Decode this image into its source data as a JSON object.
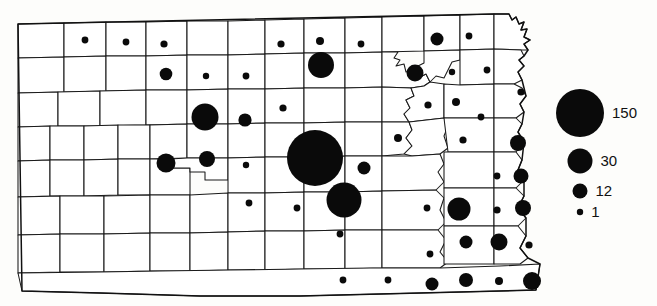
{
  "figure": {
    "type": "proportional-symbol-map",
    "region": "Kansas counties",
    "background": "#fdfdfb",
    "symbol_color": "#0a0a0a",
    "boundary_color": "#1a1a1a"
  },
  "legend": {
    "name": "symbol-size-legend",
    "entries": [
      {
        "label": "150",
        "value": 150,
        "radius": 24,
        "cx": 580,
        "cy": 113
      },
      {
        "label": "30",
        "value": 30,
        "radius": 12.5,
        "cx": 580,
        "cy": 161
      },
      {
        "label": "12",
        "value": 12,
        "radius": 7.5,
        "cx": 580,
        "cy": 191
      },
      {
        "label": "1",
        "value": 1,
        "radius": 3.2,
        "cx": 580,
        "cy": 212
      }
    ]
  },
  "chart_data": {
    "type": "scatter",
    "title": "",
    "xlabel": "",
    "ylabel": "",
    "legend_position": "right",
    "grid": false,
    "size_legend_values": [
      150,
      30,
      12,
      1
    ],
    "symbols": [
      {
        "cx": 85,
        "cy": 40,
        "r": 3.4
      },
      {
        "cx": 126,
        "cy": 42,
        "r": 3.4
      },
      {
        "cx": 164,
        "cy": 44,
        "r": 3.6
      },
      {
        "cx": 281,
        "cy": 44,
        "r": 3.6
      },
      {
        "cx": 320,
        "cy": 41,
        "r": 4.0
      },
      {
        "cx": 361,
        "cy": 44,
        "r": 3.4
      },
      {
        "cx": 437,
        "cy": 39,
        "r": 6.5
      },
      {
        "cx": 469,
        "cy": 36,
        "r": 3.4
      },
      {
        "cx": 166,
        "cy": 74,
        "r": 6.3
      },
      {
        "cx": 206,
        "cy": 76,
        "r": 3.2
      },
      {
        "cx": 246,
        "cy": 76,
        "r": 3.4
      },
      {
        "cx": 321,
        "cy": 65,
        "r": 13.0
      },
      {
        "cx": 415,
        "cy": 73,
        "r": 8.5
      },
      {
        "cx": 452,
        "cy": 72,
        "r": 3.2
      },
      {
        "cx": 487,
        "cy": 70,
        "r": 3.4
      },
      {
        "cx": 283,
        "cy": 108,
        "r": 3.6
      },
      {
        "cx": 205,
        "cy": 117,
        "r": 13.5
      },
      {
        "cx": 245,
        "cy": 120,
        "r": 6.6
      },
      {
        "cx": 428,
        "cy": 105,
        "r": 3.6
      },
      {
        "cx": 456,
        "cy": 102,
        "r": 4.0
      },
      {
        "cx": 481,
        "cy": 117,
        "r": 3.4
      },
      {
        "cx": 521,
        "cy": 92,
        "r": 3.6
      },
      {
        "cx": 518,
        "cy": 143,
        "r": 8.0
      },
      {
        "cx": 166,
        "cy": 163,
        "r": 9.5
      },
      {
        "cx": 207,
        "cy": 159,
        "r": 8.0
      },
      {
        "cx": 246,
        "cy": 165,
        "r": 3.2
      },
      {
        "cx": 398,
        "cy": 138,
        "r": 4.0
      },
      {
        "cx": 315,
        "cy": 158,
        "r": 28.0
      },
      {
        "cx": 364,
        "cy": 168,
        "r": 6.5
      },
      {
        "cx": 344,
        "cy": 200,
        "r": 17.5
      },
      {
        "cx": 249,
        "cy": 203,
        "r": 3.4
      },
      {
        "cx": 297,
        "cy": 208,
        "r": 3.4
      },
      {
        "cx": 463,
        "cy": 140,
        "r": 3.6
      },
      {
        "cx": 497,
        "cy": 176,
        "r": 3.4
      },
      {
        "cx": 521,
        "cy": 176,
        "r": 7.5
      },
      {
        "cx": 427,
        "cy": 208,
        "r": 3.4
      },
      {
        "cx": 459,
        "cy": 209,
        "r": 11.5
      },
      {
        "cx": 497,
        "cy": 210,
        "r": 3.6
      },
      {
        "cx": 523,
        "cy": 208,
        "r": 8.0
      },
      {
        "cx": 340,
        "cy": 234,
        "r": 3.4
      },
      {
        "cx": 466,
        "cy": 242,
        "r": 6.5
      },
      {
        "cx": 499,
        "cy": 242,
        "r": 8.5
      },
      {
        "cx": 529,
        "cy": 245,
        "r": 3.6
      },
      {
        "cx": 430,
        "cy": 254,
        "r": 3.4
      },
      {
        "cx": 343,
        "cy": 280,
        "r": 3.4
      },
      {
        "cx": 388,
        "cy": 280,
        "r": 3.4
      },
      {
        "cx": 432,
        "cy": 284,
        "r": 6.5
      },
      {
        "cx": 466,
        "cy": 280,
        "r": 7.0
      },
      {
        "cx": 499,
        "cy": 281,
        "r": 4.0
      },
      {
        "cx": 532,
        "cy": 281,
        "r": 9.0
      }
    ]
  }
}
